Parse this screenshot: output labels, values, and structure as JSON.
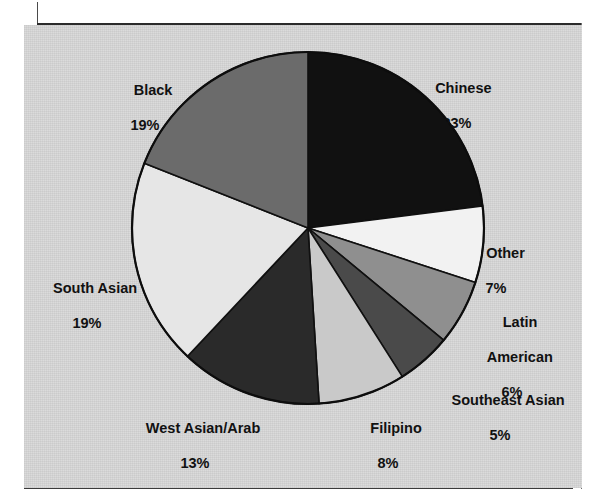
{
  "figure": {
    "background_color": "#d9d9d9",
    "page_color": "#ffffff",
    "border_color": "#2b2b2b",
    "ghost_text": "           "
  },
  "chart_data": {
    "type": "pie",
    "title": "",
    "xlabel": "",
    "ylabel": "",
    "legend_position": "none",
    "labels_outside": true,
    "start_angle_deg": 0,
    "direction": "clockwise",
    "center": {
      "x": 308,
      "y": 228
    },
    "radius": 176,
    "categories": [
      "Chinese",
      "Other",
      "Latin American",
      "Southeast Asian",
      "Filipino",
      "West Asian/Arab",
      "South Asian",
      "Black"
    ],
    "values": [
      23,
      7,
      6,
      5,
      8,
      13,
      19,
      19
    ],
    "value_suffix": "%",
    "slices": [
      {
        "label": "Chinese",
        "label_lines": [
          "Chinese"
        ],
        "pct": "23%",
        "value": 23,
        "color": "#111111",
        "text_color": "#111111"
      },
      {
        "label": "Other",
        "label_lines": [
          "Other"
        ],
        "pct": "7%",
        "value": 7,
        "color": "#f2f2f2",
        "text_color": "#111111"
      },
      {
        "label": "Latin American",
        "label_lines": [
          "Latin",
          "American"
        ],
        "pct": "6%",
        "value": 6,
        "color": "#8f8f8f",
        "text_color": "#111111"
      },
      {
        "label": "Southeast Asian",
        "label_lines": [
          "Southeast Asian"
        ],
        "pct": "5%",
        "value": 5,
        "color": "#4a4a4a",
        "text_color": "#111111"
      },
      {
        "label": "Filipino",
        "label_lines": [
          "Filipino"
        ],
        "pct": "8%",
        "value": 8,
        "color": "#c9c9c9",
        "text_color": "#111111"
      },
      {
        "label": "West Asian/Arab",
        "label_lines": [
          "West Asian/Arab"
        ],
        "pct": "13%",
        "value": 13,
        "color": "#2a2a2a",
        "text_color": "#111111"
      },
      {
        "label": "South Asian",
        "label_lines": [
          "South Asian"
        ],
        "pct": "19%",
        "value": 19,
        "color": "#e6e6e6",
        "text_color": "#111111"
      },
      {
        "label": "Black",
        "label_lines": [
          "Black"
        ],
        "pct": "19%",
        "value": 19,
        "color": "#6b6b6b",
        "text_color": "#111111"
      }
    ]
  },
  "labels": {
    "chinese": {
      "name": "Chinese",
      "pct": "23%"
    },
    "other": {
      "name": "Other",
      "pct": "7%"
    },
    "latin1": {
      "name": "Latin",
      "name2": "American",
      "pct": "6%"
    },
    "southeast": {
      "name": "Southeast Asian",
      "pct": "5%"
    },
    "filipino": {
      "name": "Filipino",
      "pct": "8%"
    },
    "west": {
      "name": "West Asian/Arab",
      "pct": "13%"
    },
    "south": {
      "name": "South Asian",
      "pct": "19%"
    },
    "black": {
      "name": "Black",
      "pct": "19%"
    }
  }
}
